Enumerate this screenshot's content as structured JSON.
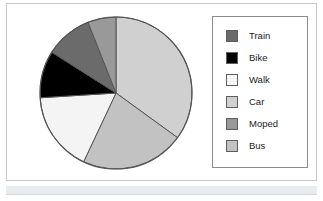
{
  "figure": {
    "frame_color": "#c9c9c9",
    "background": "#ffffff",
    "bottom_strip_color": "#e9ecef"
  },
  "legend": {
    "position": "right",
    "border_color": "#8a8a8a",
    "items": [
      {
        "label": "Train",
        "color": "#6b6b6b"
      },
      {
        "label": "Bike",
        "color": "#000000"
      },
      {
        "label": "Walk",
        "color": "#f4f4f4"
      },
      {
        "label": "Car",
        "color": "#d0d0d0"
      },
      {
        "label": "Moped",
        "color": "#999999"
      },
      {
        "label": "Bus",
        "color": "#c2c2c2"
      }
    ]
  },
  "chart_data": {
    "type": "pie",
    "title": "",
    "xlabel": "",
    "ylabel": "",
    "legend_position": "right",
    "grid": false,
    "start_angle_deg": 90,
    "direction": "clockwise",
    "categories": [
      "Car",
      "Bus",
      "Walk",
      "Bike",
      "Train",
      "Moped"
    ],
    "values": [
      35,
      22,
      17,
      10,
      10,
      6
    ],
    "colors": [
      "#d0d0d0",
      "#c2c2c2",
      "#f4f4f4",
      "#000000",
      "#6b6b6b",
      "#999999"
    ],
    "slice_edge_color": "#555555"
  }
}
